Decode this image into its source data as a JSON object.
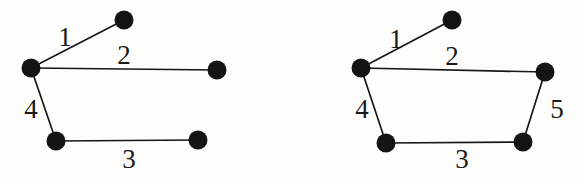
{
  "figure": {
    "background_color": "#fdfdfb",
    "ink_color": "#141414",
    "node_radius": 9.5,
    "graphs": [
      {
        "name": "left-graph",
        "nodes": [
          {
            "id": "a",
            "label": "",
            "x": 31,
            "y": 68
          },
          {
            "id": "b",
            "label": "",
            "x": 124,
            "y": 20
          },
          {
            "id": "c",
            "label": "",
            "x": 217,
            "y": 70
          },
          {
            "id": "d",
            "label": "",
            "x": 56,
            "y": 141
          },
          {
            "id": "e",
            "label": "",
            "x": 198,
            "y": 140
          }
        ],
        "edges": [
          {
            "id": "e1",
            "label": "1",
            "from": "a",
            "to": "b",
            "label_x": 65,
            "label_y": 46
          },
          {
            "id": "e2",
            "label": "2",
            "from": "a",
            "to": "c",
            "label_x": 124,
            "label_y": 64
          },
          {
            "id": "e4",
            "label": "4",
            "from": "a",
            "to": "d",
            "label_x": 31,
            "label_y": 118
          },
          {
            "id": "e3",
            "label": "3",
            "from": "d",
            "to": "e",
            "label_x": 129,
            "label_y": 168
          }
        ]
      },
      {
        "name": "right-graph",
        "nodes": [
          {
            "id": "a",
            "label": "",
            "x": 361,
            "y": 68
          },
          {
            "id": "b",
            "label": "",
            "x": 452,
            "y": 20
          },
          {
            "id": "c",
            "label": "",
            "x": 545,
            "y": 72
          },
          {
            "id": "d",
            "label": "",
            "x": 386,
            "y": 143
          },
          {
            "id": "e",
            "label": "",
            "x": 523,
            "y": 142
          }
        ],
        "edges": [
          {
            "id": "e1",
            "label": "1",
            "from": "a",
            "to": "b",
            "label_x": 396,
            "label_y": 48
          },
          {
            "id": "e2",
            "label": "2",
            "from": "a",
            "to": "c",
            "label_x": 452,
            "label_y": 65
          },
          {
            "id": "e4",
            "label": "4",
            "from": "a",
            "to": "d",
            "label_x": 362,
            "label_y": 118
          },
          {
            "id": "e3",
            "label": "3",
            "from": "d",
            "to": "e",
            "label_x": 462,
            "label_y": 168
          },
          {
            "id": "e5",
            "label": "5",
            "from": "c",
            "to": "e",
            "label_x": 557,
            "label_y": 118
          }
        ]
      }
    ]
  }
}
